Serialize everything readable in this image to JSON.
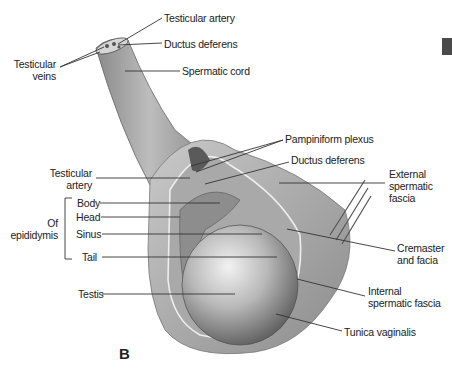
{
  "figure": {
    "panel_letter": "B",
    "labels": {
      "testicular_artery_top": "Testicular artery",
      "ductus_deferens_top": "Ductus deferens",
      "spermatic_cord": "Spermatic cord",
      "testicular_veins": "Testicular\nveins",
      "testicular_veins_line1": "Testicular",
      "testicular_veins_line2": "veins",
      "pampiniform_plexus": "Pampiniform plexus",
      "ductus_deferens_mid": "Ductus deferens",
      "testicular_artery_mid_line1": "Testicular",
      "testicular_artery_mid_line2": "artery",
      "external_spermatic_fascia_line1": "External",
      "external_spermatic_fascia_line2": "spermatic",
      "external_spermatic_fascia_line3": "fascia",
      "of_epididymis_line1": "Of",
      "of_epididymis_line2": "epididymis",
      "body": "Body",
      "head": "Head",
      "sinus": "Sinus",
      "tail": "Tail",
      "cremaster_line1": "Cremaster",
      "cremaster_line2": "and facia",
      "testis": "Testis",
      "internal_spermatic_fascia_line1": "Internal",
      "internal_spermatic_fascia_line2": "spermatic fascia",
      "tunica_vaginalis": "Tunica vaginalis"
    }
  }
}
